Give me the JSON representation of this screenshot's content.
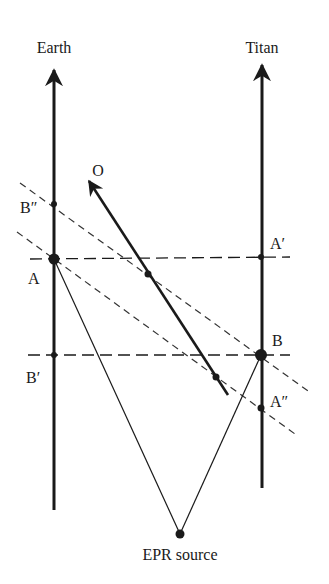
{
  "diagram": {
    "type": "spacetime diagram",
    "colors": {
      "ink": "#1a1a1a",
      "background": "#ffffff"
    },
    "worldlines": [
      {
        "id": "earth",
        "label": "Earth"
      },
      {
        "id": "titan",
        "label": "Titan"
      }
    ],
    "observer": {
      "label": "O"
    },
    "events": {
      "A": "A",
      "A_prime": "A′",
      "A_double_prime": "A″",
      "B": "B",
      "B_prime": "B′",
      "B_double_prime": "B″"
    },
    "source": {
      "label": "EPR source"
    }
  }
}
